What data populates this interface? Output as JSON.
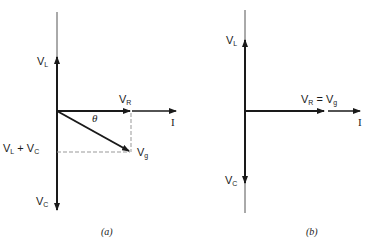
{
  "diagram_a": {
    "caption": "(a)",
    "labels": {
      "vl_main": "V",
      "vl_sub": "L",
      "vr_main": "V",
      "vr_sub": "R",
      "theta": "θ",
      "i": "I",
      "vlvc_main1": "V",
      "vlvc_sub1": "L",
      "vlvc_plus": " + ",
      "vlvc_main2": "V",
      "vlvc_sub2": "C",
      "vg_main": "V",
      "vg_sub": "g",
      "vc_main": "V",
      "vc_sub": "C"
    }
  },
  "diagram_b": {
    "caption": "(b)",
    "labels": {
      "vl_main": "V",
      "vl_sub": "L",
      "vr_main": "V",
      "vr_sub": "R",
      "eq": " = ",
      "vg_main": "V",
      "vg_sub": "g",
      "i": "I",
      "vc_main": "V",
      "vc_sub": "C"
    }
  }
}
